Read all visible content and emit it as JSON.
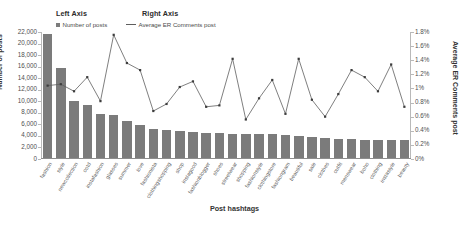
{
  "legend": {
    "left_axis_heading": "Left Axis",
    "right_axis_heading": "Right Axis",
    "bar_series_label": "Number of posts",
    "line_series_label": "Average ER Comments post"
  },
  "colors": {
    "bar": "#7b7b7b",
    "line": "#5e5e5e",
    "marker": "#3d3d3d",
    "axis": "#b9b9b9",
    "text": "#4f4f4f"
  },
  "chart_data": {
    "type": "bar",
    "title": "",
    "subtitle": "",
    "xlabel": "Post hashtags",
    "ylabel": "Number of posts",
    "ylabel_right": "Average ER Comments post",
    "grid": false,
    "legend_position": "top-left",
    "ylim": [
      0,
      22000
    ],
    "ylim_right": [
      0,
      1.8
    ],
    "ytick_labels": [
      "22,000",
      "20,000",
      "18,000",
      "16,000",
      "14,000",
      "12,000",
      "10,000",
      "8,000",
      "6,000",
      "4,000",
      "2,000",
      "0"
    ],
    "ytick_values": [
      22000,
      20000,
      18000,
      16000,
      14000,
      12000,
      10000,
      8000,
      6000,
      4000,
      2000,
      0
    ],
    "ytick_labels_right": [
      "1.8%",
      "1.6%",
      "1.4%",
      "1.2%",
      "1%",
      "0.8%",
      "0.6%",
      "0.4%",
      "0.2%",
      "0%"
    ],
    "ytick_values_right": [
      1.8,
      1.6,
      1.4,
      1.2,
      1.0,
      0.8,
      0.6,
      0.4,
      0.2,
      0
    ],
    "categories": [
      "fashion",
      "style",
      "newcollection",
      "ootd",
      "instafashion",
      "glasses",
      "summer",
      "love",
      "fashionista",
      "clothingshopping",
      "shop",
      "instagood",
      "fashionblogger",
      "shoes",
      "streetwear",
      "shopping",
      "fashionstyle",
      "clothingstore",
      "fashiongram",
      "beautiful",
      "sale",
      "clothes",
      "outfit",
      "menswear",
      "boho",
      "clothing",
      "instastyle",
      "beauty"
    ],
    "series": [
      {
        "name": "Number of posts",
        "axis": "left",
        "type": "bar",
        "values": [
          21500,
          15600,
          9800,
          9200,
          7600,
          7500,
          6400,
          5700,
          5100,
          4900,
          4600,
          4500,
          4400,
          4300,
          4200,
          4200,
          4100,
          4100,
          4000,
          3900,
          3700,
          3400,
          3300,
          3300,
          3200,
          3200,
          3100,
          3050
        ]
      },
      {
        "name": "Average ER Comments post",
        "axis": "right",
        "type": "line",
        "values": [
          1.04,
          1.06,
          0.96,
          1.16,
          0.82,
          1.76,
          1.36,
          1.26,
          0.68,
          0.78,
          1.02,
          1.1,
          0.74,
          0.76,
          1.42,
          0.56,
          0.86,
          1.12,
          0.64,
          1.42,
          0.84,
          0.6,
          0.92,
          1.26,
          1.16,
          0.96,
          1.34,
          0.74
        ]
      }
    ]
  }
}
